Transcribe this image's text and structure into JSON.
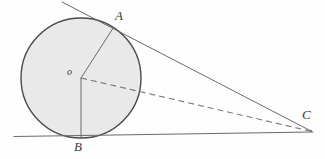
{
  "figure": {
    "background_color": "#fefefe",
    "stroke_color": "#5a5a5a",
    "circle_outline_color": "#4a4a4a",
    "circle_fill_color": "#e9e9e9",
    "label_color": "#3a3a3a"
  },
  "labels": {
    "point_a": "A",
    "point_b": "B",
    "point_c": "C",
    "center_o": "o"
  },
  "geometry": {
    "circle": {
      "center_x": 81,
      "center_y": 78,
      "radius": 60
    },
    "points": {
      "A": {
        "x": 113,
        "y": 27
      },
      "B": {
        "x": 81,
        "y": 138
      },
      "C": {
        "x": 311,
        "y": 131
      },
      "O": {
        "x": 81,
        "y": 78
      }
    },
    "segments": [
      {
        "name": "radius-oa",
        "from": "O",
        "to": "A",
        "style": "solid"
      },
      {
        "name": "radius-ob",
        "from": "O",
        "to": "B",
        "style": "solid"
      },
      {
        "name": "hypotenuse-oc",
        "from": "O",
        "to": "C",
        "style": "dashed"
      },
      {
        "name": "tangent-ac",
        "from": "A",
        "to": "C",
        "style": "solid"
      },
      {
        "name": "tangent-bc",
        "from": "B",
        "to": "C",
        "style": "solid"
      }
    ],
    "tangent_line_upper": {
      "x1": 62,
      "y1": 2,
      "x2": 311,
      "y2": 131
    },
    "tangent_line_lower": {
      "x1": 14,
      "y1": 136,
      "x2": 313,
      "y2": 132
    }
  }
}
